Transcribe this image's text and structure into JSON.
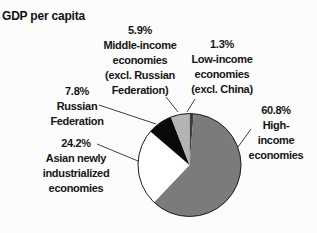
{
  "title": "GDP per capita",
  "chart_data": {
    "type": "pie",
    "title": "GDP per capita",
    "unit": "%",
    "start_angle_deg": 0,
    "direction": "clockwise",
    "outline_color": "#1a1a1a",
    "slices": [
      {
        "label": "Low-income economies (excl. China)",
        "value": 1.3,
        "color": "#3c3c3c"
      },
      {
        "label": "High-income economies",
        "value": 60.8,
        "color": "#7b7b7b"
      },
      {
        "label": "Asian newly industrialized economies",
        "value": 24.2,
        "color": "#ffffff"
      },
      {
        "label": "Russian Federation",
        "value": 7.8,
        "color": "#0a0a0a"
      },
      {
        "label": "Middle-income economies (excl. Russian Federation)",
        "value": 5.9,
        "color": "#b4b4b4"
      }
    ]
  },
  "callouts": {
    "middle_income": "5.9%\nMiddle-income\neconomies\n(excl. Russian\nFederation)",
    "low_income": "1.3%\nLow-income\neconomies\n(excl. China)",
    "high_income": "60.8%\nHigh-income\neconomies",
    "russian_federation": "7.8%\nRussian\nFederation",
    "asian_nie": "24.2%\nAsian newly\nindustrialized\neconomies"
  }
}
